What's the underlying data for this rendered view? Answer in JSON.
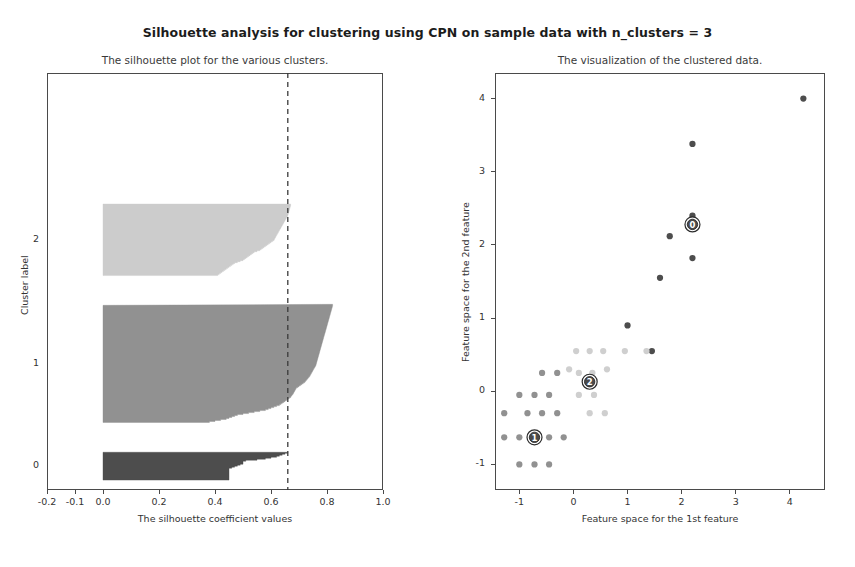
{
  "figure": {
    "title": "Silhouette analysis for clustering using CPN on sample data with n_clusters = 3",
    "n_clusters": "3",
    "background_color": "#ffffff"
  },
  "chart_data": [
    {
      "type": "area",
      "title": "The silhouette plot for the various clusters.",
      "xlabel": "The silhouette coefficient values",
      "ylabel": "Cluster label",
      "xlim": [
        -0.2,
        1.0
      ],
      "ylim": [
        0,
        420
      ],
      "grid": false,
      "xticks": [
        -0.2,
        -0.1,
        0.0,
        0.2,
        0.4,
        0.6,
        0.8,
        1.0
      ],
      "xtick_labels": [
        "-0.2",
        "-0.1",
        "0.0",
        "0.2",
        "0.4",
        "0.6",
        "0.8",
        "1.0"
      ],
      "cluster_labels": [
        "0",
        "1",
        "2"
      ],
      "average_silhouette_score": 0.66,
      "average_line_style": "dashed",
      "average_line_color": "#3a3a3a",
      "clusters": [
        {
          "label": "0",
          "color": "#4d4d4d",
          "size": 28,
          "y_start": 10,
          "y_end": 38,
          "max_silhouette": 0.66,
          "min_silhouette": 0.45,
          "silhouette_profile": [
            0.45,
            0.45,
            0.45,
            0.45,
            0.45,
            0.45,
            0.45,
            0.45,
            0.45,
            0.45,
            0.45,
            0.45,
            0.46,
            0.47,
            0.48,
            0.49,
            0.5,
            0.5,
            0.5,
            0.51,
            0.55,
            0.58,
            0.6,
            0.62,
            0.63,
            0.64,
            0.65,
            0.66
          ]
        },
        {
          "label": "1",
          "color": "#919191",
          "size": 118,
          "y_start": 68,
          "y_end": 186,
          "max_silhouette": 0.82,
          "min_silhouette": 0.38,
          "silhouette_profile": [
            0.38,
            0.4,
            0.42,
            0.44,
            0.45,
            0.46,
            0.47,
            0.48,
            0.5,
            0.52,
            0.54,
            0.56,
            0.58,
            0.59,
            0.6,
            0.61,
            0.62,
            0.63,
            0.635,
            0.64,
            0.645,
            0.65,
            0.655,
            0.66,
            0.665,
            0.67,
            0.672,
            0.675,
            0.678,
            0.68,
            0.682,
            0.684,
            0.686,
            0.688,
            0.69,
            0.695,
            0.7,
            0.705,
            0.71,
            0.715,
            0.72,
            0.723,
            0.726,
            0.729,
            0.732,
            0.735,
            0.738,
            0.74,
            0.742,
            0.744,
            0.746,
            0.748,
            0.75,
            0.752,
            0.754,
            0.756,
            0.758,
            0.76,
            0.761,
            0.762,
            0.763,
            0.764,
            0.765,
            0.766,
            0.767,
            0.768,
            0.769,
            0.77,
            0.771,
            0.772,
            0.773,
            0.774,
            0.775,
            0.776,
            0.777,
            0.778,
            0.779,
            0.78,
            0.781,
            0.782,
            0.783,
            0.784,
            0.785,
            0.786,
            0.787,
            0.788,
            0.789,
            0.79,
            0.791,
            0.792,
            0.793,
            0.794,
            0.795,
            0.796,
            0.797,
            0.798,
            0.799,
            0.8,
            0.801,
            0.802,
            0.803,
            0.804,
            0.805,
            0.806,
            0.807,
            0.808,
            0.809,
            0.81,
            0.811,
            0.812,
            0.813,
            0.814,
            0.815,
            0.816,
            0.817,
            0.818,
            0.819,
            0.82,
            0.82
          ]
        },
        {
          "label": "2",
          "color": "#cccccc",
          "size": 72,
          "y_start": 216,
          "y_end": 288,
          "max_silhouette": 0.67,
          "min_silhouette": 0.41,
          "silhouette_profile": [
            0.41,
            0.415,
            0.42,
            0.425,
            0.43,
            0.435,
            0.44,
            0.445,
            0.45,
            0.455,
            0.46,
            0.465,
            0.47,
            0.48,
            0.49,
            0.5,
            0.505,
            0.51,
            0.515,
            0.52,
            0.525,
            0.53,
            0.535,
            0.54,
            0.55,
            0.56,
            0.565,
            0.57,
            0.575,
            0.58,
            0.585,
            0.59,
            0.595,
            0.6,
            0.605,
            0.61,
            0.612,
            0.614,
            0.616,
            0.618,
            0.62,
            0.622,
            0.624,
            0.626,
            0.628,
            0.63,
            0.632,
            0.634,
            0.636,
            0.638,
            0.64,
            0.642,
            0.644,
            0.646,
            0.648,
            0.65,
            0.652,
            0.654,
            0.656,
            0.658,
            0.66,
            0.661,
            0.662,
            0.663,
            0.664,
            0.665,
            0.666,
            0.667,
            0.668,
            0.669,
            0.67,
            0.67
          ]
        }
      ]
    },
    {
      "type": "scatter",
      "title": "The visualization of the clustered data.",
      "xlabel": "Feature space for the 1st feature",
      "ylabel": "Feature space for the 2nd feature",
      "xlim": [
        -1.45,
        4.65
      ],
      "ylim": [
        -1.35,
        4.35
      ],
      "grid": false,
      "xticks": [
        -1,
        0,
        1,
        2,
        3,
        4
      ],
      "xtick_labels": [
        "-1",
        "0",
        "1",
        "2",
        "3",
        "4"
      ],
      "yticks": [
        -1,
        0,
        1,
        2,
        3,
        4
      ],
      "ytick_labels": [
        "-1",
        "0",
        "1",
        "2",
        "3",
        "4"
      ],
      "marker_size": 5,
      "series": [
        {
          "name": "cluster-0",
          "color": "#4d4d4d",
          "points": [
            [
              4.25,
              4.0
            ],
            [
              2.2,
              3.38
            ],
            [
              2.2,
              2.4
            ],
            [
              1.78,
              2.12
            ],
            [
              1.6,
              1.55
            ],
            [
              2.2,
              1.82
            ],
            [
              1.0,
              0.9
            ],
            [
              1.45,
              0.55
            ]
          ]
        },
        {
          "name": "cluster-1",
          "color": "#919191",
          "points": [
            [
              -1.0,
              -1.0
            ],
            [
              -0.72,
              -1.0
            ],
            [
              -0.45,
              -1.0
            ],
            [
              -1.0,
              -0.63
            ],
            [
              -0.72,
              -0.63
            ],
            [
              -0.45,
              -0.63
            ],
            [
              -0.18,
              -0.63
            ],
            [
              -0.85,
              -0.3
            ],
            [
              -0.58,
              -0.3
            ],
            [
              -0.3,
              -0.3
            ],
            [
              -1.0,
              -0.05
            ],
            [
              -0.72,
              -0.05
            ],
            [
              -0.45,
              -0.05
            ],
            [
              -0.58,
              0.25
            ],
            [
              -0.3,
              0.25
            ],
            [
              -1.28,
              -0.3
            ],
            [
              -1.28,
              -0.63
            ]
          ]
        },
        {
          "name": "cluster-2",
          "color": "#cfcfcf",
          "points": [
            [
              0.05,
              0.55
            ],
            [
              0.3,
              0.55
            ],
            [
              0.55,
              0.55
            ],
            [
              0.1,
              0.25
            ],
            [
              0.35,
              0.25
            ],
            [
              0.1,
              -0.05
            ],
            [
              0.38,
              -0.05
            ],
            [
              0.95,
              0.55
            ],
            [
              1.35,
              0.55
            ],
            [
              0.58,
              -0.3
            ],
            [
              0.3,
              -0.3
            ],
            [
              -0.08,
              0.3
            ],
            [
              0.62,
              0.3
            ]
          ]
        }
      ],
      "centers": [
        {
          "label": "0",
          "x": 2.2,
          "y": 2.28,
          "marker": "circled-number"
        },
        {
          "label": "1",
          "x": -0.72,
          "y": -0.63,
          "marker": "circled-number"
        },
        {
          "label": "2",
          "x": 0.3,
          "y": 0.13,
          "marker": "circled-number"
        }
      ]
    }
  ]
}
